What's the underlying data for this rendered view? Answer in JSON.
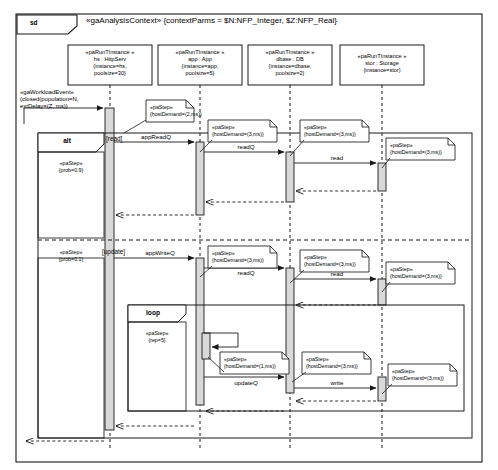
{
  "frame": {
    "tag": "sd",
    "title": "«gaAnalysisContext» {contextParms = $N:NFP_Integer, $Z:NFP_Real}"
  },
  "lifelines": [
    {
      "name": "lifeline-hs",
      "stereotype": "«paRunTInstance »",
      "instance": "hs : HttpServ",
      "props1": "{instance=hs,",
      "props2": "poolsize=30}",
      "x": 110
    },
    {
      "name": "lifeline-app",
      "stereotype": "«paRunTInstance »",
      "instance": "app : App",
      "props1": "{instance=app,",
      "props2": "poolsize=5}",
      "x": 200
    },
    {
      "name": "lifeline-dbase",
      "stereotype": "«paRunTInstance »",
      "instance": "dbase : DB",
      "props1": "{instance=dbase,",
      "props2": "poolsize=2}",
      "x": 290
    },
    {
      "name": "lifeline-stor",
      "stereotype": "«paRunTInstance »",
      "instance": "stor : Storage",
      "props1": "{instance=stor)",
      "props2": "",
      "x": 382
    }
  ],
  "workload": {
    "line1": "«gaWorkloadEvent»",
    "line2": "{closed(population=N,",
    "line3": "extDelay=(Z, ms)}"
  },
  "fragments": {
    "alt": {
      "label": "alt",
      "read_guard": "[read]",
      "update_guard": "[update]"
    },
    "loop": {
      "label": "loop"
    }
  },
  "step_notes": {
    "entry": {
      "l1": "«paStep»",
      "l2": "{hostDemand=(2,ms)}"
    },
    "h3": {
      "l1": "«paStep»",
      "l2": "{hostDemand=(3,ms)}"
    },
    "h1": {
      "l1": "«paStep»",
      "l2": "{hostDemand=(1,ms)}"
    },
    "prob09": {
      "l1": "«paStep»",
      "l2": "{prob=0.9}"
    },
    "prob01": {
      "l1": "«paStep»",
      "l2": "{prob=0.1}"
    },
    "rep5": {
      "l1": "«paStep»",
      "l2": "{rep=5}"
    }
  },
  "messages": {
    "appReadQ": "appReadQ",
    "readQ_1": "readQ",
    "read": "read",
    "appWriteQ": "appWriteQ",
    "readQ_2": "readQ",
    "updateQ": "updateQ",
    "write": "write"
  },
  "colors": {
    "line": "#1a1a1a",
    "activation_fill": "#d9d9d9",
    "note_fill": "#ffffff",
    "background": "#ffffff"
  }
}
